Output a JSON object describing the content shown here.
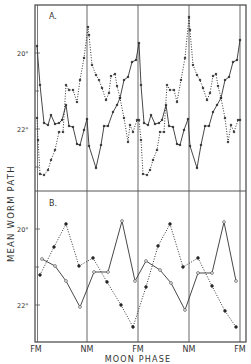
{
  "chart_data": [
    {
      "panel": "A.",
      "type": "line",
      "title": "A.",
      "xlabel": "MOON PHASE",
      "ylabel": "MEAN WORM PATH",
      "x_tick_labels": [
        "FM",
        "NM",
        "FM",
        "NM",
        "FM"
      ],
      "y_tick_labels": [
        "20°",
        "22°"
      ],
      "y_axis_inverted": true,
      "grid": "vertical lines at each moon phase",
      "series": [
        {
          "name": "solid (filled markers)",
          "style": "solid",
          "points_px": [
            [
              37,
              46
            ],
            [
              40,
              85
            ],
            [
              44,
              123
            ],
            [
              48,
              125
            ],
            [
              51,
              115
            ],
            [
              55,
              124
            ],
            [
              59,
              123
            ],
            [
              62,
              120
            ],
            [
              66,
              105
            ],
            [
              69,
              126
            ],
            [
              73,
              127
            ],
            [
              77,
              144
            ],
            [
              80,
              145
            ],
            [
              84,
              130
            ],
            [
              87,
              119
            ],
            [
              89,
              146
            ],
            [
              96,
              168
            ],
            [
              101,
              145
            ],
            [
              104,
              126
            ],
            [
              108,
              126
            ],
            [
              113,
              112
            ],
            [
              117,
              105
            ],
            [
              120,
              98
            ],
            [
              124,
              80
            ],
            [
              128,
              77
            ],
            [
              132,
              62
            ],
            [
              136,
              60
            ],
            [
              139,
              43
            ],
            [
              141,
              85
            ],
            [
              144,
              123
            ],
            [
              148,
              125
            ],
            [
              151,
              115
            ],
            [
              155,
              124
            ],
            [
              159,
              123
            ],
            [
              162,
              120
            ],
            [
              166,
              105
            ],
            [
              169,
              126
            ],
            [
              173,
              127
            ],
            [
              177,
              144
            ],
            [
              180,
              145
            ],
            [
              184,
              130
            ],
            [
              188,
              119
            ],
            [
              190,
              146
            ],
            [
              197,
              168
            ],
            [
              201,
              145
            ],
            [
              205,
              126
            ],
            [
              209,
              126
            ],
            [
              213,
              112
            ],
            [
              217,
              105
            ],
            [
              221,
              98
            ],
            [
              225,
              80
            ],
            [
              229,
              77
            ],
            [
              233,
              62
            ],
            [
              237,
              60
            ],
            [
              240,
              40
            ]
          ]
        },
        {
          "name": "dotted (filled markers)",
          "style": "dotted",
          "points_px": [
            [
              37,
              118
            ],
            [
              38,
              140
            ],
            [
              40,
              174
            ],
            [
              44,
              175
            ],
            [
              48,
              170
            ],
            [
              51,
              160
            ],
            [
              55,
              150
            ],
            [
              59,
              132
            ],
            [
              63,
              132
            ],
            [
              66,
              85
            ],
            [
              69,
              90
            ],
            [
              73,
              90
            ],
            [
              77,
              102
            ],
            [
              80,
              80
            ],
            [
              84,
              58
            ],
            [
              88,
              27
            ],
            [
              89,
              35
            ],
            [
              92,
              65
            ],
            [
              96,
              75
            ],
            [
              99,
              80
            ],
            [
              102,
              88
            ],
            [
              106,
              100
            ],
            [
              109,
              93
            ],
            [
              111,
              76
            ],
            [
              115,
              74
            ],
            [
              117,
              86
            ],
            [
              120,
              98
            ],
            [
              124,
              118
            ],
            [
              128,
              142
            ],
            [
              130,
              125
            ],
            [
              133,
              132
            ],
            [
              137,
              120
            ],
            [
              139,
              120
            ],
            [
              141,
              140
            ],
            [
              143,
              174
            ],
            [
              147,
              175
            ],
            [
              150,
              170
            ],
            [
              153,
              160
            ],
            [
              157,
              150
            ],
            [
              160,
              132
            ],
            [
              164,
              132
            ],
            [
              167,
              85
            ],
            [
              170,
              90
            ],
            [
              174,
              90
            ],
            [
              177,
              102
            ],
            [
              181,
              80
            ],
            [
              185,
              58
            ],
            [
              189,
              17
            ],
            [
              190,
              30
            ],
            [
              193,
              65
            ],
            [
              197,
              75
            ],
            [
              200,
              80
            ],
            [
              203,
              88
            ],
            [
              207,
              100
            ],
            [
              210,
              93
            ],
            [
              213,
              76
            ],
            [
              216,
              74
            ],
            [
              218,
              86
            ],
            [
              221,
              98
            ],
            [
              225,
              118
            ],
            [
              228,
              142
            ],
            [
              231,
              125
            ],
            [
              234,
              132
            ],
            [
              238,
              120
            ],
            [
              240,
              120
            ]
          ]
        }
      ]
    },
    {
      "panel": "B.",
      "type": "line",
      "title": "B.",
      "xlabel": "MOON PHASE",
      "ylabel": "MEAN WORM PATH",
      "x_tick_labels": [
        "FM",
        "NM",
        "FM",
        "NM",
        "FM"
      ],
      "y_tick_labels": [
        "20°",
        "22°"
      ],
      "y_axis_inverted": true,
      "series": [
        {
          "name": "solid (open circles)",
          "style": "solid",
          "marker": "open-circle",
          "points_px": [
            [
              42,
              259
            ],
            [
              55,
              266
            ],
            [
              66,
              281
            ],
            [
              80,
              307
            ],
            [
              94,
              272
            ],
            [
              108,
              272
            ],
            [
              122,
              221
            ],
            [
              135,
              281
            ],
            [
              146,
              261
            ],
            [
              160,
              270
            ],
            [
              171,
              283
            ],
            [
              185,
              310
            ],
            [
              198,
              273
            ],
            [
              212,
              273
            ],
            [
              224,
              222
            ],
            [
              236,
              281
            ]
          ]
        },
        {
          "name": "dotted (filled circles)",
          "style": "dotted",
          "marker": "filled-circle",
          "points_px": [
            [
              40,
              275
            ],
            [
              54,
              247
            ],
            [
              66,
              224
            ],
            [
              79,
              266
            ],
            [
              93,
              258
            ],
            [
              107,
              282
            ],
            [
              121,
              305
            ],
            [
              133,
              327
            ],
            [
              146,
              287
            ],
            [
              158,
              246
            ],
            [
              170,
              224
            ],
            [
              183,
              267
            ],
            [
              198,
              258
            ],
            [
              212,
              286
            ],
            [
              225,
              311
            ],
            [
              236,
              327
            ]
          ]
        }
      ]
    }
  ],
  "labels": {
    "panel_a": "A.",
    "panel_b": "B.",
    "y_axis_title": "MEAN WORM PATH",
    "x_axis_title": "MOON PHASE",
    "a_tick_20": "20°",
    "a_tick_22": "22°",
    "b_tick_20": "20°",
    "b_tick_22": "22°",
    "x_ticks": [
      "FM",
      "NM",
      "FM",
      "NM",
      "FM"
    ]
  }
}
